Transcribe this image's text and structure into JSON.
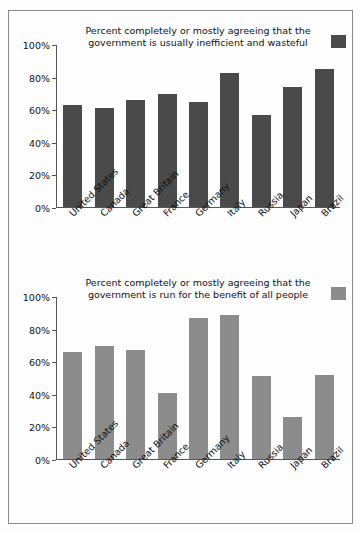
{
  "chart_data": [
    {
      "type": "bar",
      "title": "Percent completely or mostly agreeing that the government is usually inefficient and wasteful",
      "title_line1": "Percent completely or mostly agreeing that the",
      "title_line2": "government is usually inefficient and wasteful",
      "xlabel": "",
      "ylabel": "",
      "ylim": [
        0,
        100
      ],
      "yticks": [
        0,
        20,
        40,
        60,
        80,
        100
      ],
      "ytick_labels": [
        "0%",
        "20%",
        "40%",
        "60%",
        "80%",
        "100%"
      ],
      "grid": false,
      "legend_position": "top-right",
      "bar_color": "#4a4a4a",
      "categories": [
        "United States",
        "Canada",
        "Great Britain",
        "France",
        "Germany",
        "Italy",
        "Russia",
        "Japan",
        "Brazil"
      ],
      "values": [
        63,
        61,
        66,
        70,
        65,
        83,
        57,
        74,
        85
      ]
    },
    {
      "type": "bar",
      "title": "Percent completely or mostly agreeing that the government is run for the benefit of all people",
      "title_line1": "Percent completely or mostly agreeing that the",
      "title_line2": "government is run for the benefit of all people",
      "xlabel": "",
      "ylabel": "",
      "ylim": [
        0,
        100
      ],
      "yticks": [
        0,
        20,
        40,
        60,
        80,
        100
      ],
      "ytick_labels": [
        "0%",
        "20%",
        "40%",
        "60%",
        "80%",
        "100%"
      ],
      "grid": false,
      "legend_position": "top-right",
      "bar_color": "#8c8c8c",
      "categories": [
        "United States",
        "Canada",
        "Great Britain",
        "France",
        "Germany",
        "Italy",
        "Russia",
        "Japan",
        "Brazil"
      ],
      "values": [
        66,
        70,
        67,
        41,
        87,
        89,
        51,
        26,
        52
      ]
    }
  ]
}
